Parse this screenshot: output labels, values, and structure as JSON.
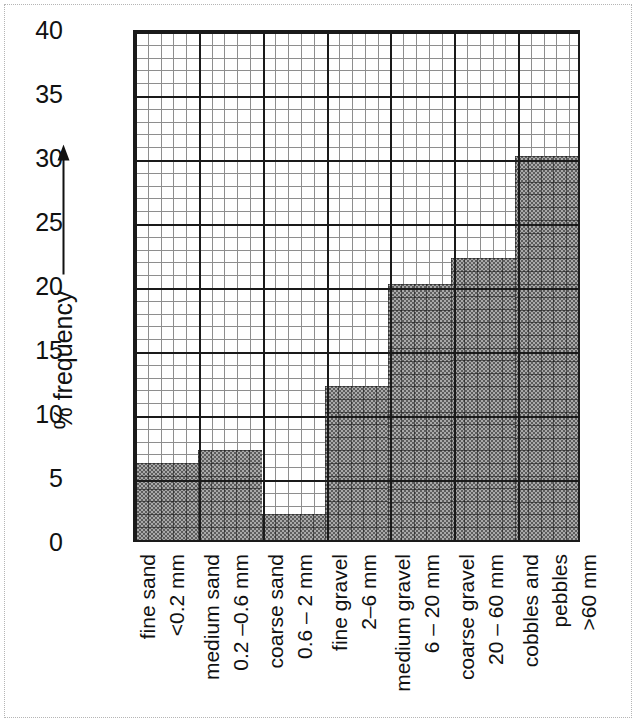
{
  "chart_data": {
    "type": "bar",
    "title": "",
    "subtitle": "",
    "xlabel": "",
    "ylabel": "% frequency",
    "ylabel_arrow": "up-arrow",
    "ylim": [
      0,
      40
    ],
    "y_major_step": 5,
    "y_minor_step": 1,
    "grid": true,
    "grid_style": "graph-paper",
    "legend": "none",
    "bar_fill_color": "#7f7f7f",
    "bar_fill_pattern": "dither-checkerboard",
    "axis_color": "#1a1a1a",
    "categories": [
      "fine sand <0.2 mm",
      "medium sand 0.2 –0.6 mm",
      "coarse sand 0.6 – 2 mm",
      "fine gravel 2–6 mm",
      "medium gravel 6 – 20 mm",
      "coarse gravel 20 – 60 mm",
      "cobbles and pebbles >60 mm"
    ],
    "values": [
      6,
      7,
      2,
      12,
      20,
      22,
      30
    ],
    "y_ticks": [
      "0",
      "5",
      "10",
      "15",
      "20",
      "25",
      "30",
      "35",
      "40"
    ],
    "y_tick_values": [
      0,
      5,
      10,
      15,
      20,
      25,
      30,
      35,
      40
    ]
  },
  "axis": {
    "y_title": "% frequency",
    "ticks": [
      {
        "label": "40",
        "value": 40
      },
      {
        "label": "35",
        "value": 35
      },
      {
        "label": "30",
        "value": 30
      },
      {
        "label": "25",
        "value": 25
      },
      {
        "label": "20",
        "value": 20
      },
      {
        "label": "15",
        "value": 15
      },
      {
        "label": "10",
        "value": 10
      },
      {
        "label": "5",
        "value": 5
      },
      {
        "label": "0",
        "value": 0
      }
    ]
  },
  "x_categories": [
    {
      "name": "fine sand",
      "size": "<0.2 mm",
      "value": 6
    },
    {
      "name": "medium sand",
      "size": "0.2 –0.6 mm",
      "value": 7
    },
    {
      "name": "coarse sand",
      "size": "0.6 – 2 mm",
      "value": 2
    },
    {
      "name": "fine gravel",
      "size": "2–6 mm",
      "value": 12
    },
    {
      "name": "medium gravel",
      "size": "6 – 20 mm",
      "value": 20
    },
    {
      "name": "coarse gravel",
      "size": "20 – 60 mm",
      "value": 22
    },
    {
      "name": "cobbles and",
      "size2": "pebbles",
      "size": ">60 mm",
      "value": 30
    }
  ]
}
